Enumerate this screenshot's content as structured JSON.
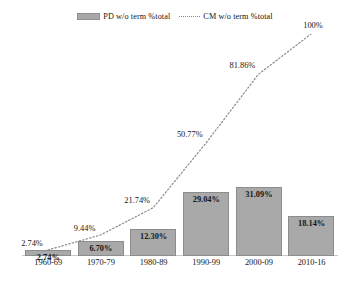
{
  "chart_data": {
    "type": "bar",
    "title": "",
    "subtitle": "",
    "xlabel": "",
    "ylabel": "",
    "ylim": [
      0,
      100
    ],
    "grid": false,
    "legend_position": "top-center",
    "categories": [
      "1960-69",
      "1970-79",
      "1980-89",
      "1990-99",
      "2000-09",
      "2010-16"
    ],
    "series": [
      {
        "name": "PD w/o term %total",
        "type": "bar",
        "color": "#a9a9a9",
        "values": [
          2.74,
          6.7,
          12.3,
          29.04,
          31.09,
          18.14
        ],
        "labels": [
          "2.74%",
          "6.70%",
          "12.30%",
          "29.04%",
          "31.09%",
          "18.14%"
        ]
      },
      {
        "name": "CM w/o term %total",
        "type": "line",
        "style": "dotted",
        "color": "#8a8a8a",
        "values": [
          2.74,
          9.44,
          21.74,
          50.77,
          81.86,
          100
        ],
        "labels": [
          "2.74%",
          "9.44%",
          "21.74%",
          "50.77%",
          "81.86%",
          "100%"
        ]
      }
    ]
  },
  "legend": {
    "entries": [
      {
        "label": "PD w/o term %total",
        "marker": "bar-swatch"
      },
      {
        "label": "CM w/o term %total",
        "marker": "dotted-line-swatch"
      }
    ]
  },
  "colors": {
    "bar_fill": "#a9a9a9",
    "bar_stroke": "#8c8c8c",
    "line": "#8a8a8a",
    "text": "#171717",
    "background": "#ffffff"
  }
}
